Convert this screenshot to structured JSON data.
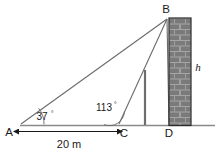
{
  "diagram": {
    "type": "trigonometry-elevation-diagram",
    "points": {
      "A": {
        "label": "A",
        "x": 16,
        "y": 126
      },
      "B": {
        "label": "B",
        "x": 167,
        "y": 16
      },
      "C": {
        "label": "C",
        "x": 118,
        "y": 126
      },
      "D": {
        "label": "D",
        "x": 169,
        "y": 126
      }
    },
    "angles": [
      {
        "name": "angle-at-A",
        "label": "37",
        "degree_symbol": "°",
        "vertex": "A",
        "value": 37
      },
      {
        "name": "angle-at-C",
        "label": "113",
        "degree_symbol": "°",
        "vertex": "C",
        "value": 113
      }
    ],
    "dimensions": [
      {
        "name": "baseline-AC",
        "label": "20 m",
        "value": 20,
        "unit": "m",
        "from": "A",
        "to": "C"
      }
    ],
    "height_label": "h",
    "colors": {
      "line": "#6b6b6b",
      "text": "#1a1a1a",
      "wall_fill": "#7a7a7a",
      "wall_mortar": "#9a9a9a",
      "wall_outline": "#2a2a2a",
      "ground": "#8a8a8a",
      "post": "#6e6e6e",
      "background": "#ffffff"
    },
    "wall": {
      "name": "brick-wall",
      "left": 169,
      "right": 191,
      "top": 18,
      "bottom": 126
    },
    "post": {
      "name": "vertical-post",
      "x": 145,
      "top": 70,
      "bottom": 125
    }
  }
}
